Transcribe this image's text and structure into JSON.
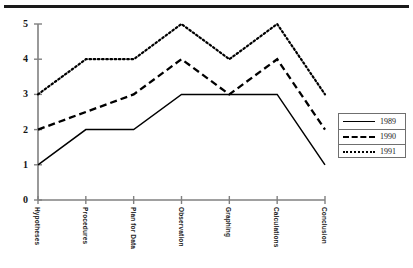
{
  "chart_data": {
    "type": "line",
    "title": "",
    "subtitle": "",
    "xlabel": "",
    "ylabel": "",
    "ylim": [
      0,
      5
    ],
    "yticks": [
      "0",
      "1",
      "2",
      "3",
      "4",
      "5"
    ],
    "grid": false,
    "legend_position": "right",
    "categories": [
      "Hypotheses",
      "Procedures",
      "Plan for Data",
      "Observation",
      "Graphing",
      "Calculations",
      "Conclusion"
    ],
    "series": [
      {
        "name": "1989",
        "style": "solid",
        "color": "#000000",
        "values": [
          1,
          2,
          2,
          3,
          3,
          3,
          1
        ]
      },
      {
        "name": "1990",
        "style": "dashed",
        "color": "#000000",
        "values": [
          2,
          2.5,
          3,
          4,
          3,
          4,
          2
        ]
      },
      {
        "name": "1991",
        "style": "dotted",
        "color": "#000000",
        "values": [
          3,
          4,
          4,
          5,
          4,
          5,
          3
        ]
      }
    ]
  },
  "legend": {
    "entries": [
      {
        "label": "1989"
      },
      {
        "label": "1990"
      },
      {
        "label": "1991"
      }
    ]
  },
  "axis": {
    "y_tick_labels": [
      "5",
      "4",
      "3",
      "2",
      "1",
      "0"
    ],
    "x_tick_labels": [
      "Hypotheses",
      "Procedures",
      "Plan for Data",
      "Observation",
      "Graphing",
      "Calculations",
      "Conclusion"
    ]
  },
  "colors": {
    "axis": "#808080",
    "line": "#000000",
    "rule": "#1a1a1a",
    "legend_border": "#6f6f6f"
  }
}
